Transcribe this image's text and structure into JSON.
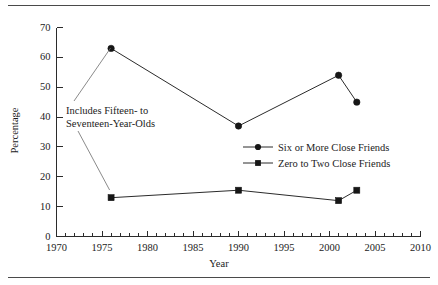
{
  "chart_data": {
    "type": "line",
    "title": "",
    "xlabel": "Year",
    "ylabel": "Percentage",
    "xlim": [
      1970,
      2010
    ],
    "ylim": [
      0,
      70
    ],
    "grid": false,
    "legend_position": "center-right",
    "x_major_ticks": [
      1970,
      1975,
      1980,
      1985,
      1990,
      1995,
      2000,
      2005,
      2010
    ],
    "x_minor_tick_step": 1,
    "y_ticks": [
      0,
      10,
      20,
      30,
      40,
      50,
      60,
      70
    ],
    "series": [
      {
        "name": "Six or More Close Friends",
        "marker": "circle",
        "x": [
          1976,
          1990,
          2001,
          2003
        ],
        "values": [
          63,
          37,
          54,
          45
        ]
      },
      {
        "name": "Zero to Two Close Friends",
        "marker": "square",
        "x": [
          1976,
          1990,
          2001,
          2003
        ],
        "values": [
          13,
          15.5,
          12,
          15.5
        ]
      }
    ],
    "annotations": [
      {
        "text_line_1": "Includes Fifteen- to",
        "text_line_2": "Seventeen-Year-Olds",
        "points_to_year": 1976
      }
    ],
    "colors": {
      "line": "#2b2b2b",
      "marker": "#161616",
      "axis": "#2b2b2b",
      "rule": "#4a4a4a",
      "background": "#ffffff"
    }
  },
  "axis": {
    "y_tick_labels": [
      "0",
      "10",
      "20",
      "30",
      "40",
      "50",
      "60",
      "70"
    ],
    "x_tick_labels": [
      "1970",
      "1975",
      "1980",
      "1985",
      "1990",
      "1995",
      "2000",
      "2005",
      "2010"
    ],
    "x_title": "Year",
    "y_title": "Percentage"
  },
  "annotation": {
    "line1": "Includes Fifteen- to",
    "line2": "Seventeen-Year-Olds"
  },
  "legend": {
    "entries": [
      {
        "label": "Six or More Close Friends",
        "marker": "circle-marker"
      },
      {
        "label": "Zero to Two Close Friends",
        "marker": "square-marker"
      }
    ]
  }
}
